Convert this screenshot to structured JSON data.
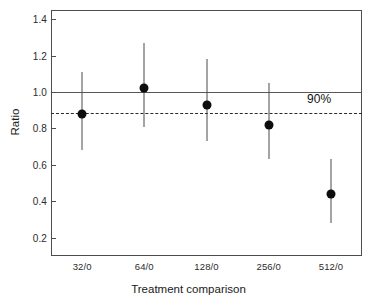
{
  "chart_data": {
    "type": "scatter",
    "title": "",
    "xlabel": "Treatment comparison",
    "ylabel": "Ratio",
    "categories": [
      "32/0",
      "64/0",
      "128/0",
      "256/0",
      "512/0"
    ],
    "values": [
      0.88,
      1.02,
      0.93,
      0.82,
      0.44
    ],
    "error_upper": [
      1.11,
      1.27,
      1.18,
      1.05,
      0.63
    ],
    "error_lower": [
      0.68,
      0.81,
      0.73,
      0.63,
      0.28
    ],
    "series": [
      {
        "name": "Ratio with confidence interval",
        "values": [
          0.88,
          1.02,
          0.93,
          0.82,
          0.44
        ],
        "upper": [
          1.11,
          1.27,
          1.18,
          1.05,
          0.63
        ],
        "lower": [
          0.68,
          0.81,
          0.73,
          0.63,
          0.28
        ]
      }
    ],
    "ylim": [
      0.1,
      1.45
    ],
    "yticks": [
      0.2,
      0.4,
      0.6,
      0.8,
      1.0,
      1.2,
      1.4
    ],
    "ytick_labels": [
      "0.2",
      "0.4",
      "0.6",
      "0.8",
      "1.0",
      "1.2",
      "1.4"
    ],
    "xtick_labels": [
      "32/0",
      "64/0",
      "128/0",
      "256/0",
      "512/0"
    ],
    "grid": false,
    "legend": "none",
    "reference_lines": [
      {
        "name": "unity-line",
        "value": 1.0,
        "style": "solid",
        "label": ""
      },
      {
        "name": "ninety-percent-line",
        "value": 0.885,
        "style": "dashed",
        "label": "90%"
      }
    ],
    "annotations": [
      {
        "name": "ninety-percent-label",
        "text": "90%",
        "x": 0.92,
        "y": 0.955
      }
    ],
    "colors": {
      "marker": "#0d0d0d",
      "errorbar": "#4a4a4a",
      "solid_reference": "#55595c",
      "dashed_reference": "#2a2a2a",
      "axis": "#4d4d4d",
      "text": "#1a1a1a",
      "background": "#ffffff"
    }
  },
  "axis": {
    "y_title": "Ratio",
    "x_title": "Treatment comparison"
  },
  "annotation": {
    "ninety_percent": "90%"
  }
}
